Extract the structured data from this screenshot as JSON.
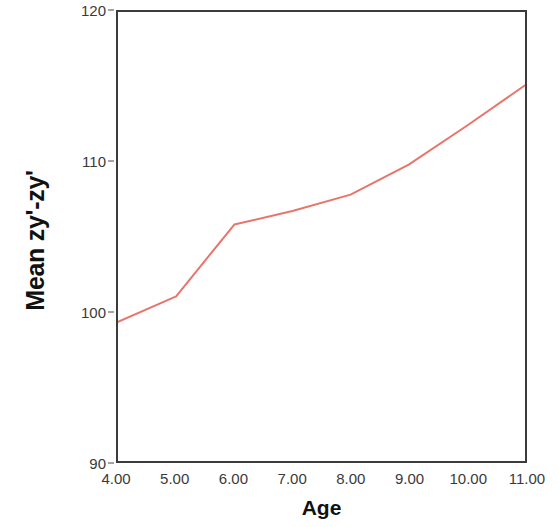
{
  "chart_data": {
    "type": "line",
    "title": "",
    "subtitle": "",
    "xlabel": "Age",
    "ylabel": "Mean zy'-zy'",
    "x": [
      4,
      5,
      6,
      7,
      8,
      9,
      10,
      11
    ],
    "xtick_labels": [
      "4.00",
      "5.00",
      "6.00",
      "7.00",
      "8.00",
      "9.00",
      "10.00",
      "11.00"
    ],
    "ytick_labels": [
      "120",
      "110",
      "100",
      "90"
    ],
    "ytick_values": [
      120,
      110,
      100,
      90
    ],
    "xlim": [
      4,
      11
    ],
    "ylim": [
      90,
      120
    ],
    "grid": false,
    "legend": "none",
    "series": [
      {
        "name": "Mean zy'-zy'",
        "color": "#e8746a",
        "values": [
          99.3,
          101.0,
          105.8,
          106.7,
          107.8,
          109.8,
          112.4,
          115.1
        ]
      }
    ]
  },
  "axes": {
    "y_title": "Mean zy'-zy'",
    "x_title": "Age",
    "frame_color": "#3b3b3b",
    "tick_color": "#4a4a4a",
    "label_color": "#3a3a3a"
  }
}
